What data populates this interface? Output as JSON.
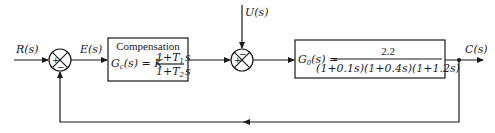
{
  "diagram": {
    "type": "control-system-block-diagram",
    "signals": {
      "input": "R(s)",
      "error": "E(s)",
      "disturbance": "U(s)",
      "output": "C(s)"
    },
    "summing_junction_1": {
      "left_sign": "+",
      "bottom_sign": "−"
    },
    "summing_junction_2": {
      "left_sign": "+",
      "top_sign": "−"
    },
    "compensator": {
      "title": "Compensation",
      "lhs": "G",
      "lhs_sub": "c",
      "lhs_arg": "(s) = K",
      "numerator": "1+T",
      "numerator_sub": "1",
      "numerator_tail": "s",
      "denominator": "1+T",
      "denominator_sub": "2",
      "denominator_tail": "s"
    },
    "plant": {
      "lhs": "G",
      "lhs_sub": "0",
      "lhs_arg": "(s) =",
      "numerator": "2.2",
      "denominator": "(1+0.1s)(1+0.4s)(1+1.2s)"
    },
    "feedback": "unity negative feedback from C(s) to first summing junction"
  }
}
